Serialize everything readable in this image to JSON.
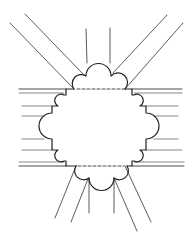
{
  "diagram": {
    "title": "",
    "colors": {
      "background": "#ffffff",
      "line": "#2a2a2a",
      "thin_line": "#555555"
    },
    "elements": [
      {
        "id": "top-passage",
        "label": ""
      },
      {
        "id": "left-passage",
        "label": ""
      },
      {
        "id": "right-passage",
        "label": ""
      },
      {
        "id": "bottom-passage",
        "label": ""
      },
      {
        "id": "top-left-diagonal",
        "label": ""
      },
      {
        "id": "top-right-diagonal",
        "label": ""
      },
      {
        "id": "bottom-left-diagonal",
        "label": ""
      },
      {
        "id": "bottom-right-diagonal",
        "label": ""
      },
      {
        "id": "central-lobed-space",
        "label": ""
      }
    ]
  }
}
